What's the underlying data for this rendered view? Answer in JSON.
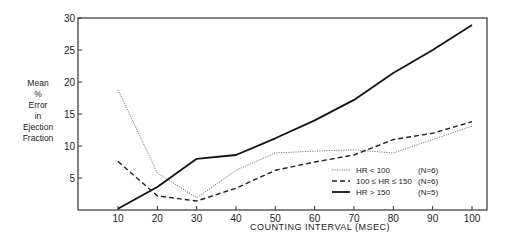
{
  "chart_data": {
    "type": "line",
    "title": "",
    "xlabel": "COUNTING INTERVAL (MSEC)",
    "ylabel": "Mean % Error in Ejection Fraction",
    "ylabel_lines": [
      "Mean",
      "%",
      "Error",
      "in",
      "Ejection",
      "Fraction"
    ],
    "x": [
      10,
      20,
      30,
      40,
      50,
      60,
      70,
      80,
      90,
      100
    ],
    "x_ticks": [
      "10",
      "20",
      "30",
      "40",
      "50",
      "60",
      "70",
      "80",
      "90",
      "100"
    ],
    "y_ticks": [
      "5",
      "10",
      "15",
      "20",
      "25",
      "30"
    ],
    "xlim": [
      0,
      103
    ],
    "ylim": [
      0,
      30
    ],
    "grid": false,
    "legend_position": "lower right",
    "series": [
      {
        "name": "HR < 100",
        "n_label": "(N=6)",
        "style": "dotted",
        "values": [
          18.8,
          5.8,
          1.9,
          6.2,
          8.9,
          9.2,
          9.4,
          8.9,
          11.0,
          13.1
        ]
      },
      {
        "name": "100 ≤ HR ≤ 150",
        "n_label": "(N=6)",
        "style": "dashed",
        "values": [
          7.6,
          2.2,
          1.4,
          3.4,
          6.2,
          7.5,
          8.6,
          11.0,
          12.0,
          13.8
        ]
      },
      {
        "name": "HR > 150",
        "n_label": "(N=5)",
        "style": "solid",
        "values": [
          0.2,
          3.6,
          8.0,
          8.6,
          11.2,
          14.0,
          17.2,
          21.4,
          25.0,
          28.9
        ]
      }
    ]
  }
}
